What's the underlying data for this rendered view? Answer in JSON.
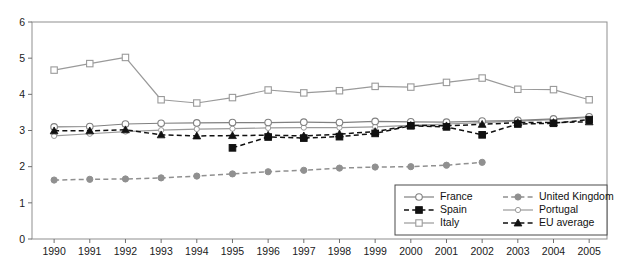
{
  "chart_data": {
    "type": "line",
    "title": "",
    "xlabel": "",
    "ylabel": "",
    "xlim": [
      1990,
      2005
    ],
    "ylim": [
      0,
      6
    ],
    "yticks": [
      0,
      1,
      2,
      3,
      4,
      5,
      6
    ],
    "grid": false,
    "legend_position": "bottom-right",
    "categories": [
      1990,
      1991,
      1992,
      1993,
      1994,
      1995,
      1996,
      1997,
      1998,
      1999,
      2000,
      2001,
      2002,
      2003,
      2004,
      2005
    ],
    "x": [
      "1990",
      "1991",
      "1992",
      "1993",
      "1994",
      "1995",
      "1996",
      "1997",
      "1998",
      "1999",
      "2000",
      "2001",
      "2002",
      "2003",
      "2004",
      "2005"
    ],
    "series": [
      {
        "name": "France",
        "marker": "open-circle",
        "line": "solid",
        "color": "#808080",
        "values": [
          3.1,
          3.11,
          3.18,
          3.2,
          3.21,
          3.22,
          3.22,
          3.23,
          3.22,
          3.25,
          3.24,
          3.23,
          3.26,
          3.28,
          3.32,
          3.38
        ]
      },
      {
        "name": "Spain",
        "marker": "filled-square",
        "line": "dashed",
        "color": "#111111",
        "values": [
          null,
          null,
          null,
          null,
          null,
          2.52,
          2.82,
          2.79,
          2.83,
          2.92,
          3.13,
          3.1,
          2.88,
          3.18,
          3.2,
          3.3
        ]
      },
      {
        "name": "Italy",
        "marker": "open-square",
        "line": "solid",
        "color": "#9a9a9a",
        "values": [
          4.67,
          4.85,
          5.02,
          3.85,
          3.76,
          3.91,
          4.12,
          4.04,
          4.1,
          4.22,
          4.2,
          4.33,
          4.45,
          4.14,
          4.13,
          3.85
        ]
      },
      {
        "name": "United Kingdom",
        "marker": "filled-circle",
        "line": "dashed",
        "color": "#909090",
        "values": [
          1.63,
          1.65,
          1.66,
          1.69,
          1.74,
          1.8,
          1.86,
          1.9,
          1.96,
          1.99,
          2.0,
          2.04,
          2.12,
          null,
          null,
          null
        ]
      },
      {
        "name": "Portugal",
        "marker": "open-circle-small",
        "line": "solid",
        "color": "#9a9a9a",
        "values": [
          2.85,
          2.91,
          2.97,
          3.01,
          3.04,
          3.05,
          3.07,
          3.08,
          3.08,
          3.1,
          3.14,
          3.18,
          3.22,
          3.26,
          3.3,
          3.36
        ]
      },
      {
        "name": "EU average",
        "marker": "filled-triangle",
        "line": "dashed",
        "color": "#111111",
        "values": [
          2.99,
          2.99,
          3.02,
          2.88,
          2.85,
          2.86,
          2.87,
          2.85,
          2.9,
          2.97,
          3.14,
          3.13,
          3.17,
          3.22,
          3.22,
          3.24
        ]
      }
    ]
  },
  "legend": {
    "items": [
      {
        "label": "France"
      },
      {
        "label": "United Kingdom"
      },
      {
        "label": "Spain"
      },
      {
        "label": "Portugal"
      },
      {
        "label": "Italy"
      },
      {
        "label": "EU average"
      }
    ]
  }
}
